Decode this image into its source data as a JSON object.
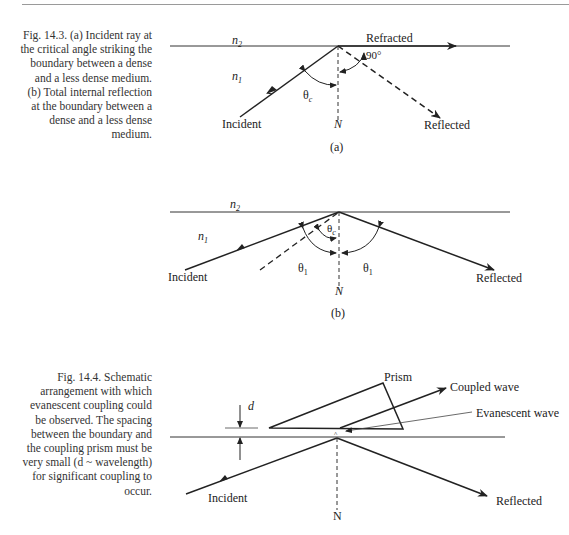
{
  "figures": [
    {
      "id": "fig-14-3",
      "caption": "Fig. 14.3.  (a) Incident ray at the critical angle striking the boundary between a dense and a less dense medium. (b) Total internal reflection at the boundary between a dense and a less dense medium.",
      "panel_a": {
        "medium_top": "n",
        "medium_top_sub": "2",
        "medium_bottom": "n",
        "medium_bottom_sub": "1",
        "label_refracted": "Refracted",
        "label_angle_90": "90°",
        "label_theta": "θ",
        "label_theta_sub": "c",
        "label_incident": "Incident",
        "label_normal": "N",
        "label_reflected": "Reflected",
        "panel_label": "(a)"
      },
      "panel_b": {
        "medium_top": "n",
        "medium_top_sub": "2",
        "medium_bottom": "n",
        "medium_bottom_sub": "1",
        "label_theta_c": "θ",
        "label_theta_c_sub": "c",
        "label_theta1_left": "θ",
        "label_theta1_left_sub": "1",
        "label_theta1_right": "θ",
        "label_theta1_right_sub": "1",
        "label_incident": "Incident",
        "label_normal": "N",
        "label_reflected": "Reflected",
        "panel_label": "(b)"
      }
    },
    {
      "id": "fig-14-4",
      "caption": "Fig. 14.4.  Schematic arrangement with which evanescent coupling could be observed. The spacing between the boundary and the coupling prism must be very small (d ~ wavelength) for significant coupling to occur.",
      "labels": {
        "prism": "Prism",
        "coupled_wave": "Coupled wave",
        "evanescent_wave": "Evanescent wave",
        "spacing": "d",
        "incident": "Incident",
        "normal": "N",
        "reflected": "Reflected"
      }
    }
  ]
}
